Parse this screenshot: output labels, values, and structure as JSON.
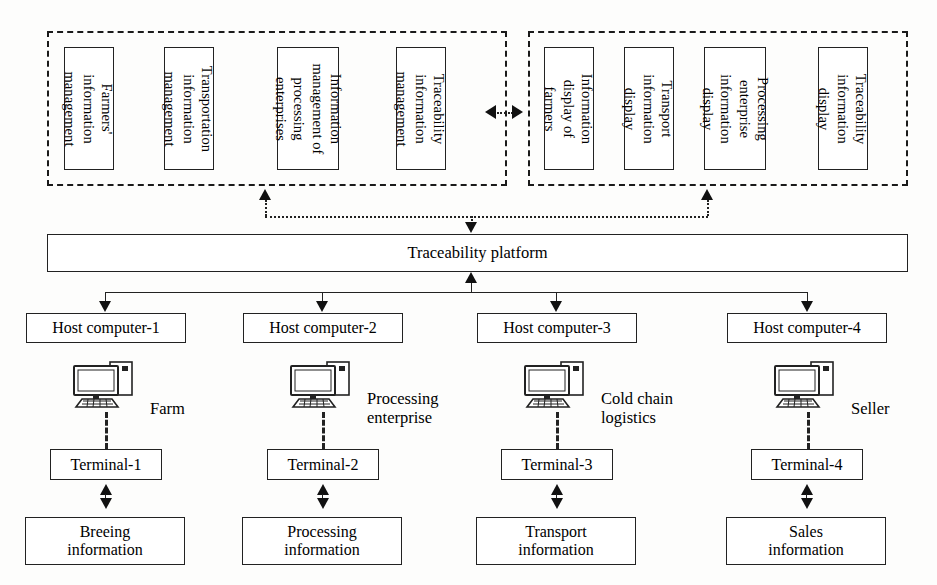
{
  "diagram": {
    "colors": {
      "line": "#222222",
      "background": "#ffffff",
      "text": "#000000"
    }
  },
  "management_group": {
    "name": "management-module-group",
    "boxes": [
      {
        "label": "Farmers'\ninformation\nmanagement"
      },
      {
        "label": "Transportation\ninformation\nmanagement"
      },
      {
        "label": "Information\nmanagement of\nprocessing\nenterprises"
      },
      {
        "label": "Traceability\ninformation\nmanagement"
      }
    ]
  },
  "display_group": {
    "name": "display-module-group",
    "boxes": [
      {
        "label": "Information\ndisplay of\nfarmers"
      },
      {
        "label": "Transport\ninformation\ndisplay"
      },
      {
        "label": "Processing\nenterprise\ninformation\ndisplay"
      },
      {
        "label": "Traceability\ninformation\ndisplay"
      }
    ]
  },
  "platform": {
    "label": "Traceability platform"
  },
  "columns": [
    {
      "host": "Host computer-1",
      "role": "Farm",
      "terminal": "Terminal-1",
      "information": "Breeing\ninformation",
      "icon": "desktop-computer-icon"
    },
    {
      "host": "Host computer-2",
      "role": "Processing\nenterprise",
      "terminal": "Terminal-2",
      "information": "Processing\ninformation",
      "icon": "desktop-computer-icon"
    },
    {
      "host": "Host computer-3",
      "role": "Cold chain\nlogistics",
      "terminal": "Terminal-3",
      "information": "Transport\ninformation",
      "icon": "desktop-computer-icon"
    },
    {
      "host": "Host computer-4",
      "role": "Seller",
      "terminal": "Terminal-4",
      "information": "Sales\ninformation",
      "icon": "desktop-computer-icon"
    }
  ]
}
